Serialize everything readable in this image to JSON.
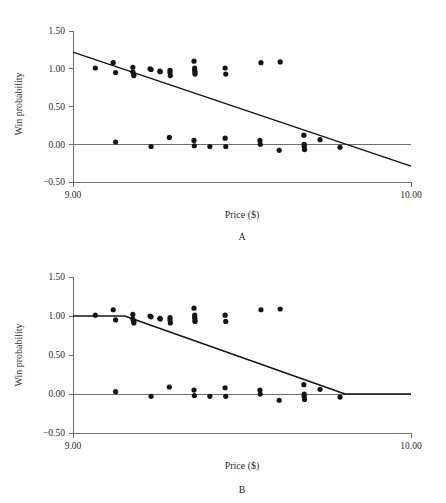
{
  "figure": {
    "background": "#ffffff",
    "ink_color": "#141414",
    "axis_color": "#6e6e6e"
  },
  "chart_data": [
    {
      "type": "scatter",
      "panel_label": "A",
      "title": "",
      "xlabel": "Price ($)",
      "ylabel": "Win probability",
      "xlim": [
        9.0,
        10.0
      ],
      "ylim": [
        -0.5,
        1.5
      ],
      "xticks": [
        9.0,
        10.0
      ],
      "xticklabels": [
        "9.00",
        "10.00"
      ],
      "yticks": [
        -0.5,
        0.0,
        0.5,
        1.0,
        1.5
      ],
      "yticklabels": [
        "-0.50",
        "0.00",
        "0.50",
        "1.00",
        "1.50"
      ],
      "grid": false,
      "legend": "none",
      "reference_line_y": 0.0,
      "fit": {
        "kind": "linear",
        "label": "ordinary least squares fit",
        "points": [
          [
            9.0,
            1.22
          ],
          [
            10.0,
            -0.29
          ]
        ]
      },
      "points": [
        [
          9.066,
          1.01
        ],
        [
          9.119,
          1.08
        ],
        [
          9.126,
          0.95
        ],
        [
          9.177,
          1.02
        ],
        [
          9.177,
          0.96
        ],
        [
          9.18,
          0.93
        ],
        [
          9.18,
          0.91
        ],
        [
          9.228,
          1.0
        ],
        [
          9.231,
          0.99
        ],
        [
          9.257,
          0.97
        ],
        [
          9.258,
          0.96
        ],
        [
          9.287,
          0.98
        ],
        [
          9.287,
          0.95
        ],
        [
          9.288,
          0.91
        ],
        [
          9.358,
          1.1
        ],
        [
          9.36,
          1.01
        ],
        [
          9.36,
          0.98
        ],
        [
          9.361,
          0.95
        ],
        [
          9.361,
          0.93
        ],
        [
          9.45,
          1.01
        ],
        [
          9.452,
          0.93
        ],
        [
          9.556,
          1.08
        ],
        [
          9.613,
          1.09
        ],
        [
          9.126,
          0.03
        ],
        [
          9.231,
          -0.03
        ],
        [
          9.285,
          0.09
        ],
        [
          9.358,
          0.05
        ],
        [
          9.359,
          -0.02
        ],
        [
          9.405,
          -0.03
        ],
        [
          9.45,
          0.08
        ],
        [
          9.452,
          -0.03
        ],
        [
          9.553,
          0.05
        ],
        [
          9.554,
          0.0
        ],
        [
          9.61,
          -0.08
        ],
        [
          9.683,
          0.12
        ],
        [
          9.684,
          0.0
        ],
        [
          9.684,
          -0.03
        ],
        [
          9.685,
          -0.07
        ],
        [
          9.731,
          0.06
        ],
        [
          9.79,
          -0.04
        ]
      ]
    },
    {
      "type": "scatter",
      "panel_label": "B",
      "title": "",
      "xlabel": "Price ($)",
      "ylabel": "Win probability",
      "xlim": [
        9.0,
        10.0
      ],
      "ylim": [
        -0.5,
        1.5
      ],
      "xticks": [
        9.0,
        10.0
      ],
      "xticklabels": [
        "9.00",
        "10.00"
      ],
      "yticks": [
        -0.5,
        0.0,
        0.5,
        1.0,
        1.5
      ],
      "yticklabels": [
        "-0.50",
        "0.00",
        "0.50",
        "1.00",
        "1.50"
      ],
      "grid": false,
      "legend": "none",
      "reference_line_y": 0.0,
      "fit": {
        "kind": "piecewise-linear",
        "label": "constrained monotone fit",
        "points": [
          [
            9.0,
            1.0
          ],
          [
            9.153,
            1.0
          ],
          [
            9.805,
            0.0
          ],
          [
            10.0,
            0.0
          ]
        ]
      },
      "points": [
        [
          9.066,
          1.01
        ],
        [
          9.119,
          1.08
        ],
        [
          9.126,
          0.95
        ],
        [
          9.177,
          1.02
        ],
        [
          9.177,
          0.96
        ],
        [
          9.18,
          0.93
        ],
        [
          9.18,
          0.91
        ],
        [
          9.228,
          1.0
        ],
        [
          9.231,
          0.99
        ],
        [
          9.257,
          0.97
        ],
        [
          9.258,
          0.96
        ],
        [
          9.287,
          0.98
        ],
        [
          9.287,
          0.95
        ],
        [
          9.288,
          0.91
        ],
        [
          9.358,
          1.1
        ],
        [
          9.36,
          1.01
        ],
        [
          9.36,
          0.98
        ],
        [
          9.361,
          0.95
        ],
        [
          9.361,
          0.93
        ],
        [
          9.45,
          1.01
        ],
        [
          9.452,
          0.93
        ],
        [
          9.556,
          1.08
        ],
        [
          9.613,
          1.09
        ],
        [
          9.126,
          0.03
        ],
        [
          9.231,
          -0.03
        ],
        [
          9.285,
          0.09
        ],
        [
          9.358,
          0.05
        ],
        [
          9.359,
          -0.02
        ],
        [
          9.405,
          -0.03
        ],
        [
          9.45,
          0.08
        ],
        [
          9.452,
          -0.03
        ],
        [
          9.553,
          0.05
        ],
        [
          9.554,
          0.0
        ],
        [
          9.61,
          -0.08
        ],
        [
          9.683,
          0.12
        ],
        [
          9.684,
          0.0
        ],
        [
          9.684,
          -0.03
        ],
        [
          9.685,
          -0.07
        ],
        [
          9.731,
          0.06
        ],
        [
          9.79,
          -0.04
        ]
      ]
    }
  ]
}
